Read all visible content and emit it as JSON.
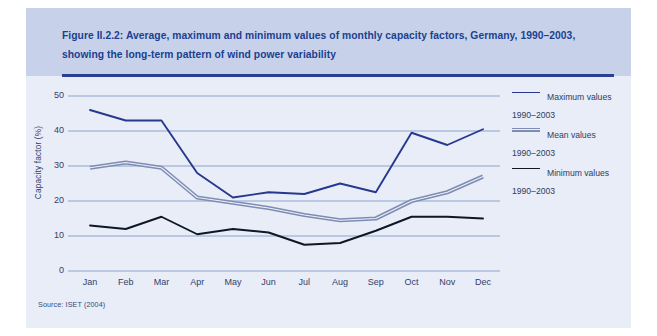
{
  "figure": {
    "caption": "Figure II.2.2: Average, maximum and minimum values of monthly capacity factors, Germany, 1990–2003, showing the long-term pattern of wind power variability",
    "source": "Source: ISET (2004)"
  },
  "colors": {
    "panel_background": "#e8edf7",
    "caption_background": "#c7d2ea",
    "caption_text": "#1c3f8f",
    "caption_rule": "#2b3f91",
    "gridline": "#8fa3cf",
    "axis_text": "#32406b",
    "maximum_line": "#27388f",
    "mean_line": "#7e8cb4",
    "minimum_line": "#0e1726"
  },
  "legend": {
    "position": "right",
    "entries": [
      {
        "label": "Maximum values\n1990–2003",
        "swatch": "thin",
        "color": "#27388f",
        "name": "legend-maximum"
      },
      {
        "label": "Mean values\n1990–2003",
        "swatch": "striped",
        "color": "#7e8cb4",
        "name": "legend-mean"
      },
      {
        "label": "Minimum values\n1990–2003",
        "swatch": "thin",
        "color": "#0e1726",
        "name": "legend-minimum"
      }
    ]
  },
  "chart_data": {
    "type": "line",
    "title": "Figure II.2.2: Average, maximum and minimum values of monthly capacity factors, Germany, 1990–2003, showing the long-term pattern of wind power variability",
    "xlabel": "",
    "ylabel": "Capacity factor (%)",
    "categories": [
      "Jan",
      "Feb",
      "Mar",
      "Apr",
      "May",
      "Jun",
      "Jul",
      "Aug",
      "Sep",
      "Oct",
      "Nov",
      "Dec"
    ],
    "ylim": [
      0,
      50
    ],
    "yticks": [
      0,
      10,
      20,
      30,
      40,
      50
    ],
    "grid": true,
    "legend_position": "right",
    "series": [
      {
        "name": "Maximum values 1990–2003",
        "color": "#27388f",
        "values": [
          46.0,
          43.0,
          43.0,
          28.0,
          21.0,
          22.5,
          22.0,
          25.0,
          22.5,
          39.5,
          36.0,
          40.5
        ]
      },
      {
        "name": "Mean values 1990–2003",
        "color": "#7e8cb4",
        "values": [
          29.5,
          31.0,
          29.5,
          21.0,
          19.5,
          18.0,
          16.0,
          14.5,
          15.0,
          20.0,
          22.5,
          27.0
        ]
      },
      {
        "name": "Minimum values 1990–2003",
        "color": "#0e1726",
        "values": [
          13.0,
          12.0,
          15.5,
          10.5,
          12.0,
          11.0,
          7.5,
          8.0,
          11.5,
          15.5,
          15.5,
          15.0
        ]
      }
    ]
  }
}
